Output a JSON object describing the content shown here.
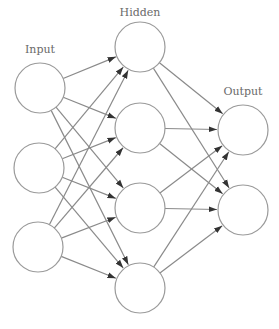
{
  "layers": [
    {
      "id": "input",
      "label": "Input",
      "label_pos": [
        40,
        53
      ],
      "nodes": [
        [
          40,
          88
        ],
        [
          39,
          168
        ],
        [
          38,
          247
        ]
      ]
    },
    {
      "id": "hidden",
      "label": "Hidden",
      "label_pos": [
        140,
        16
      ],
      "nodes": [
        [
          140,
          47
        ],
        [
          140,
          128
        ],
        [
          140,
          208
        ],
        [
          140,
          288
        ]
      ]
    },
    {
      "id": "output",
      "label": "Output",
      "label_pos": [
        243,
        95
      ],
      "nodes": [
        [
          243,
          130
        ],
        [
          243,
          210
        ]
      ]
    }
  ],
  "node_radius": 25,
  "colors": {
    "stroke": "#9a9a9a",
    "edge": "#8a8a8a",
    "arrow": "#444444",
    "label": "#6a6a6a"
  },
  "connectivity": "fully-connected feedforward with arrows"
}
